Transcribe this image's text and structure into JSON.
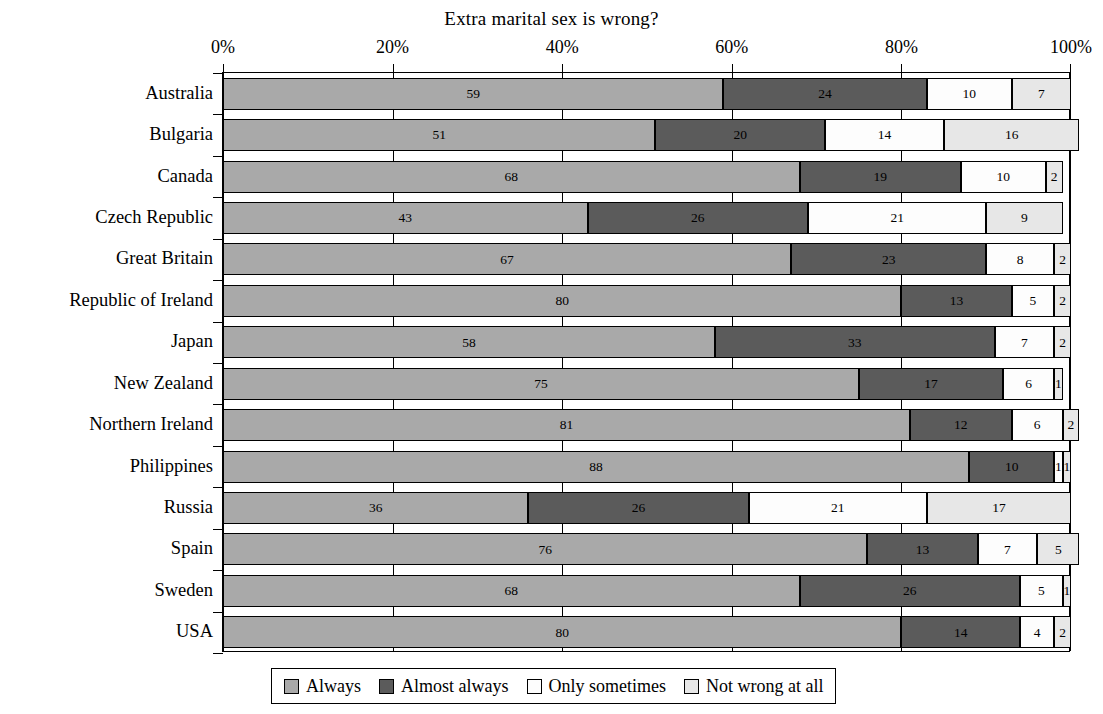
{
  "chart_data": {
    "type": "bar",
    "orientation": "horizontal",
    "stacked": true,
    "stack_mode": "percent",
    "title": "Extra marital sex is wrong?",
    "xlabel": "",
    "ylabel": "",
    "xlim": [
      0,
      100
    ],
    "xticks": [
      "0%",
      "20%",
      "40%",
      "60%",
      "80%",
      "100%"
    ],
    "xtick_values": [
      0,
      20,
      40,
      60,
      80,
      100
    ],
    "grid": true,
    "legend_position": "bottom",
    "categories": [
      "Australia",
      "Bulgaria",
      "Canada",
      "Czech Republic",
      "Great Britain",
      "Republic of Ireland",
      "Japan",
      "New Zealand",
      "Northern Ireland",
      "Philippines",
      "Russia",
      "Spain",
      "Sweden",
      "USA"
    ],
    "series": [
      {
        "name": "Always",
        "color": "#a9a9a9",
        "values": [
          59,
          51,
          68,
          43,
          67,
          80,
          58,
          75,
          81,
          88,
          36,
          76,
          68,
          80
        ]
      },
      {
        "name": "Almost always",
        "color": "#5b5b5b",
        "values": [
          24,
          20,
          19,
          26,
          23,
          13,
          33,
          17,
          12,
          10,
          26,
          13,
          26,
          14
        ]
      },
      {
        "name": "Only sometimes",
        "color": "#fdfdfd",
        "values": [
          10,
          14,
          10,
          21,
          8,
          5,
          7,
          6,
          6,
          1,
          21,
          7,
          5,
          4
        ]
      },
      {
        "name": "Not wrong at all",
        "color": "#e7e7e7",
        "values": [
          7,
          16,
          2,
          9,
          2,
          2,
          2,
          1,
          2,
          1,
          17,
          5,
          1,
          2
        ]
      }
    ]
  },
  "legend": {
    "items": [
      {
        "label": "Always",
        "swatch": "#a9a9a9"
      },
      {
        "label": "Almost always",
        "swatch": "#5b5b5b"
      },
      {
        "label": "Only sometimes",
        "swatch": "#fdfdfd"
      },
      {
        "label": "Not wrong at all",
        "swatch": "#e7e7e7"
      }
    ]
  }
}
